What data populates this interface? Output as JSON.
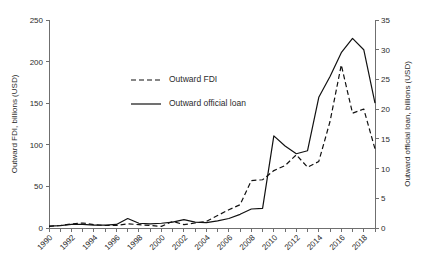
{
  "chart_data": {
    "type": "line",
    "title": "",
    "xlabel": "",
    "ylabel": "Outward FDI, billions (USD)",
    "y2label": "Outward official loan, billions (USD)",
    "grid": false,
    "legend_position": "upper-left-inside",
    "x": [
      1990,
      1991,
      1992,
      1993,
      1994,
      1995,
      1996,
      1997,
      1998,
      1999,
      2000,
      2001,
      2002,
      2003,
      2004,
      2005,
      2006,
      2007,
      2008,
      2009,
      2010,
      2011,
      2012,
      2013,
      2014,
      2015,
      2016,
      2017,
      2018,
      2019
    ],
    "x_tick_labels": [
      "1990",
      "1992",
      "1994",
      "1996",
      "1998",
      "2000",
      "2002",
      "2004",
      "2006",
      "2008",
      "2010",
      "2012",
      "2014",
      "2016",
      "2018"
    ],
    "xlim": [
      1990,
      2019
    ],
    "ylim": [
      0,
      250
    ],
    "y_ticks": [
      0,
      50,
      100,
      150,
      200,
      250
    ],
    "y2lim": [
      0,
      35
    ],
    "y2_ticks": [
      0,
      5,
      10,
      15,
      20,
      25,
      30,
      35
    ],
    "series": [
      {
        "name": "Outward FDI",
        "axis": "left",
        "style": "dashed",
        "color": "#111111",
        "values": [
          2,
          3,
          5,
          6,
          4,
          3,
          3,
          5,
          4,
          3,
          2,
          8,
          4,
          6,
          8,
          15,
          22,
          28,
          57,
          58,
          69,
          75,
          88,
          73,
          80,
          128,
          196,
          138,
          143,
          95
        ]
      },
      {
        "name": "Outward official loan",
        "axis": "right",
        "style": "solid",
        "color": "#111111",
        "values": [
          0.3,
          0.4,
          0.6,
          0.6,
          0.5,
          0.5,
          0.6,
          1.6,
          0.8,
          0.7,
          0.8,
          1.0,
          1.4,
          1.0,
          0.9,
          1.2,
          1.6,
          2.3,
          3.2,
          3.3,
          15.5,
          13.8,
          12.5,
          13.0,
          22.0,
          25.5,
          29.5,
          31.9,
          30.0,
          21.0
        ]
      }
    ],
    "legend": [
      {
        "label": "Outward FDI",
        "style": "dashed"
      },
      {
        "label": "Outward official loan",
        "style": "solid"
      }
    ]
  },
  "axes": {
    "left_title": "Outward FDI, billions (USD)",
    "right_title": "Outward official loan, billions (USD)",
    "left_ticks": [
      "0",
      "50",
      "100",
      "150",
      "200",
      "250"
    ],
    "right_ticks": [
      "0",
      "5",
      "10",
      "15",
      "20",
      "25",
      "30",
      "35"
    ],
    "x_ticks": [
      "1990",
      "1992",
      "1994",
      "1996",
      "1998",
      "2000",
      "2002",
      "2004",
      "2006",
      "2008",
      "2010",
      "2012",
      "2014",
      "2016",
      "2018"
    ]
  }
}
